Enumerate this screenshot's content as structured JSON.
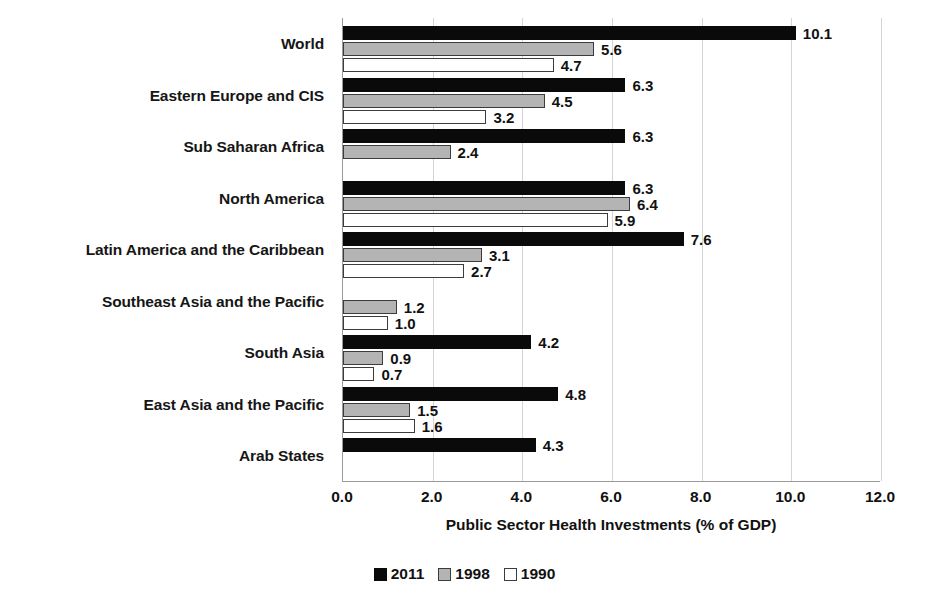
{
  "chart_data": {
    "type": "bar",
    "orientation": "horizontal",
    "title": "",
    "xlabel": "Public Sector Health Investments (% of GDP)",
    "ylabel": "",
    "xlim": [
      0.0,
      12.0
    ],
    "xticks": [
      "0.0",
      "2.0",
      "4.0",
      "6.0",
      "8.0",
      "10.0",
      "12.0"
    ],
    "xtick_values": [
      0,
      2,
      4,
      6,
      8,
      10,
      12
    ],
    "grid": "vertical",
    "legend_position": "bottom",
    "categories": [
      "World",
      "Eastern Europe and CIS",
      "Sub Saharan Africa",
      "North America",
      "Latin America and the Caribbean",
      "Southeast Asia and the Pacific",
      "South Asia",
      "East Asia and the Pacific",
      "Arab States"
    ],
    "series": [
      {
        "name": "2011",
        "color": "#0a0a0a",
        "values": [
          10.1,
          6.3,
          6.3,
          6.3,
          7.6,
          null,
          4.2,
          4.8,
          4.3
        ],
        "labels": [
          "10.1",
          "6.3",
          "6.3",
          "6.3",
          "7.6",
          "",
          "4.2",
          "4.8",
          "4.3"
        ]
      },
      {
        "name": "1998",
        "color": "#b4b4b4",
        "values": [
          5.6,
          4.5,
          2.4,
          6.4,
          3.1,
          1.2,
          0.9,
          1.5,
          null
        ],
        "labels": [
          "5.6",
          "4.5",
          "2.4",
          "6.4",
          "3.1",
          "1.2",
          "0.9",
          "1.5",
          ""
        ]
      },
      {
        "name": "1990",
        "color": "#ffffff",
        "values": [
          4.7,
          3.2,
          null,
          5.9,
          2.7,
          1.0,
          0.7,
          1.6,
          null
        ],
        "labels": [
          "4.7",
          "3.2",
          "",
          "5.9",
          "2.7",
          "1.0",
          "0.7",
          "1.6",
          ""
        ]
      }
    ]
  },
  "legend": {
    "items": [
      {
        "label": "2011",
        "swatch": "black-filled-square"
      },
      {
        "label": "1998",
        "swatch": "grey-filled-square"
      },
      {
        "label": "1990",
        "swatch": "white-outline-square"
      }
    ]
  }
}
